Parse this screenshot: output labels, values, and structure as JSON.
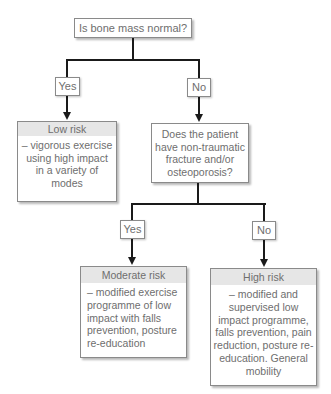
{
  "diagram": {
    "root_question": "Is bone mass normal?",
    "branch1": {
      "yes_label": "Yes",
      "no_label": "No"
    },
    "low_risk": {
      "title": "Low risk",
      "text": "– vigorous exercise using high impact in a variety of modes"
    },
    "second_question": "Does the patient have non-traumatic fracture and/or osteoporosis?",
    "branch2": {
      "yes_label": "Yes",
      "no_label": "No"
    },
    "moderate_risk": {
      "title": "Moderate risk",
      "text": "– modified exercise programme of low impact with falls prevention, posture re-education"
    },
    "high_risk": {
      "title": "High risk",
      "text": "– modified and supervised low impact programme, falls prevention, pain reduction, posture re-education. General mobility"
    }
  }
}
